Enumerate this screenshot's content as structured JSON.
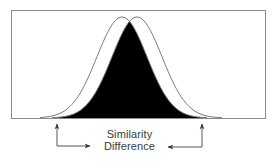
{
  "diagram": {
    "labels": {
      "similarity": "Similarity",
      "difference": "Difference"
    },
    "colors": {
      "frame": "#8a8a8a",
      "curve_outline": "#7a7a7a",
      "overlap_fill": "#000000",
      "background": "#ffffff",
      "arrow": "#444444",
      "text": "#3a3a3a"
    },
    "curves": [
      {
        "name": "left-distribution",
        "center_x": 122,
        "sigma": 25,
        "peak_y": 17,
        "baseline_y": 118
      },
      {
        "name": "right-distribution",
        "center_x": 137,
        "sigma": 25,
        "peak_y": 17,
        "baseline_y": 118
      }
    ],
    "overlap": {
      "description": "shared area of the two distributions (shaded black)"
    },
    "arrows": [
      {
        "name": "left-arrow",
        "points_to": "left tail of left distribution"
      },
      {
        "name": "right-arrow",
        "points_to": "right tail of right distribution"
      }
    ]
  }
}
